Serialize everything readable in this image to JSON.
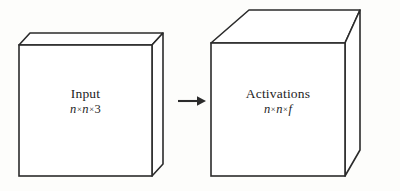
{
  "diagram": {
    "type": "block-diagram",
    "background_color": "#fdfdfb",
    "stroke_color": "#2b2b2b",
    "face_fill": "#ffffff",
    "blocks": [
      {
        "id": "input",
        "title": "Input",
        "dims": {
          "text": "n × n × 3",
          "parts": [
            "n",
            "n",
            "3"
          ],
          "separator": "×"
        },
        "shape": "thin-slab"
      },
      {
        "id": "activations",
        "title": "Activations",
        "dims": {
          "text": "n × n × f",
          "parts": [
            "n",
            "n",
            "f"
          ],
          "separator": "×"
        },
        "shape": "cube"
      }
    ],
    "connector": {
      "kind": "arrow",
      "direction": "right",
      "from": "input",
      "to": "activations"
    }
  }
}
